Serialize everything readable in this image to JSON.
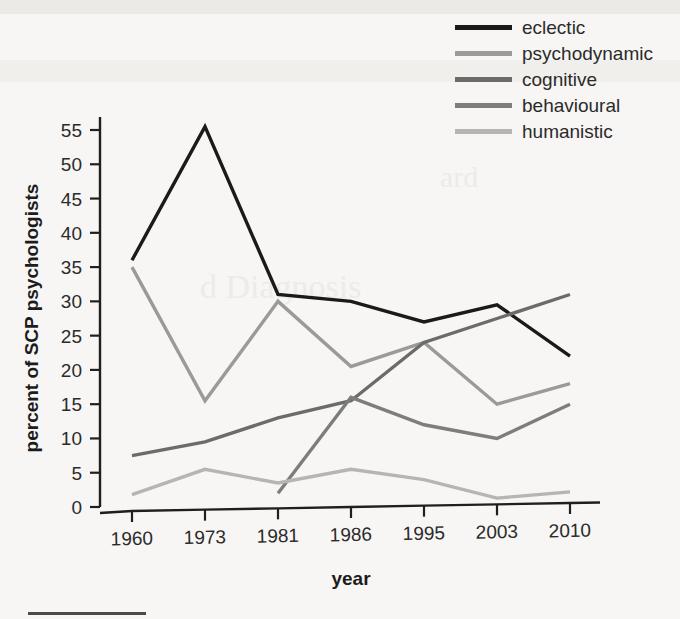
{
  "chart_data": {
    "type": "line",
    "title": "",
    "xlabel": "year",
    "ylabel": "percent of SCP psychologists",
    "categories": [
      "1960",
      "1973",
      "1981",
      "1986",
      "1995",
      "2003",
      "2010"
    ],
    "ylim": [
      0,
      57
    ],
    "yticks": [
      "0",
      "5",
      "10",
      "15",
      "20",
      "25",
      "30",
      "35",
      "40",
      "45",
      "50",
      "55"
    ],
    "grid": false,
    "legend_position": "top-right",
    "series": [
      {
        "name": "eclectic",
        "color": "#1a1a1a",
        "values": [
          36,
          55.5,
          31,
          30,
          27,
          29.5,
          22
        ]
      },
      {
        "name": "psychodynamic",
        "color": "#9a9a9a",
        "values": [
          35,
          15.5,
          30,
          20.5,
          24,
          15,
          18
        ]
      },
      {
        "name": "cognitive",
        "color": "#6b6b6b",
        "values": [
          7.5,
          9.5,
          13,
          15.5,
          24,
          27.5,
          31
        ]
      },
      {
        "name": "behavioural",
        "color": "#7d7d7d",
        "values": [
          null,
          null,
          2,
          16,
          12,
          10,
          15
        ]
      },
      {
        "name": "humanistic",
        "color": "#b5b5b5",
        "values": [
          1.8,
          5.5,
          3.5,
          5.5,
          4,
          1.3,
          2.2
        ]
      }
    ]
  },
  "legend": {
    "items": [
      {
        "label": "eclectic",
        "color": "#1a1a1a"
      },
      {
        "label": "psychodynamic",
        "color": "#9a9a9a"
      },
      {
        "label": "cognitive",
        "color": "#6b6b6b"
      },
      {
        "label": "behavioural",
        "color": "#7d7d7d"
      },
      {
        "label": "humanistic",
        "color": "#b5b5b5"
      }
    ]
  },
  "ghost": {
    "line_a": "ard",
    "line_b": "d Diagnosis"
  }
}
